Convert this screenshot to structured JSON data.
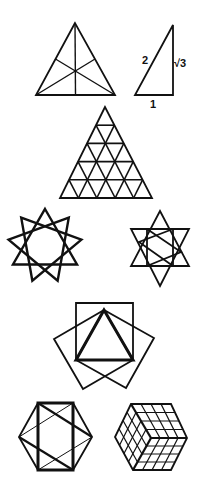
{
  "figures": [
    {
      "id": "triangle-medians",
      "description": "Equilateral triangle with three medians meeting at centroid"
    },
    {
      "id": "right-triangle-30-60-90",
      "description": "30-60-90 right triangle with side lengths",
      "labels": {
        "hypotenuse": "2",
        "long_leg": "√3",
        "short_leg": "1"
      }
    },
    {
      "id": "triangular-grid",
      "description": "Equilateral triangle subdivided into 5 rows of small triangles",
      "rows": 5
    },
    {
      "id": "nine-pointed-star",
      "description": "Nine-pointed star formed by three overlapping triangles",
      "points": 9
    },
    {
      "id": "hexagram-with-inner-figure",
      "description": "Six-pointed star with inscribed rectangle and inner crossing triangles",
      "points": 6
    },
    {
      "id": "triangle-with-squares",
      "description": "Bold equilateral triangle with a square erected on each side"
    },
    {
      "id": "hexagon-with-rectangle",
      "description": "Regular hexagon with inscribed bold rectangle and diagonals"
    },
    {
      "id": "isometric-cube",
      "description": "Cube drawn in isometric view with 4x4 grid on each face",
      "grid": 4
    }
  ]
}
